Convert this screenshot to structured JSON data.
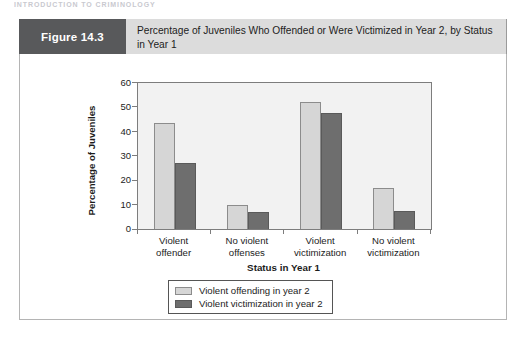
{
  "page": {
    "running_head": "INTRODUCTION TO CRIMINOLOGY"
  },
  "figure": {
    "number_label": "Figure 14.3",
    "caption": "Percentage of Juveniles Who Offended or Were Victimized in Year 2, by Status in Year 1",
    "header_block_color": "#58595b",
    "caption_background_color": "#dcdcdc"
  },
  "chart_data": {
    "type": "bar",
    "title": "Percentage of Juveniles Who Offended or Were Victimized in Year 2, by Status in Year 1",
    "xlabel": "Status in Year 1",
    "ylabel": "Percentage of Juveniles",
    "categories": [
      "Violent offender",
      "No violent offenses",
      "Violent victimization",
      "No violent victimization"
    ],
    "category_lines": [
      [
        "Violent",
        "offender"
      ],
      [
        "No violent",
        "offenses"
      ],
      [
        "Violent",
        "victimization"
      ],
      [
        "No violent",
        "victimization"
      ]
    ],
    "series": [
      {
        "name": "Violent offending in year 2",
        "color": "#d6d6d6",
        "values": [
          43.5,
          10,
          52,
          17
        ]
      },
      {
        "name": "Violent victimization in year 2",
        "color": "#6e6e6e",
        "values": [
          27,
          7,
          47.5,
          7.5
        ]
      }
    ],
    "ylim": [
      0,
      60
    ],
    "yticks": [
      0,
      10,
      20,
      30,
      40,
      50,
      60
    ],
    "ytick_labels": [
      "0",
      "10",
      "20",
      "30",
      "40",
      "50",
      "60"
    ],
    "grid": false,
    "legend_position": "bottom-center",
    "plot_background_color": "#f2f2f2"
  }
}
